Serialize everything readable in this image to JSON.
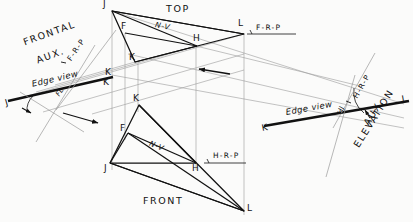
{
  "drawing": {
    "title": "Descriptive geometry — edge views of plane JKL",
    "ink_color": "#111111",
    "light_ink_color": "#8a8a8a",
    "paper_color": "#fbfbfa"
  },
  "views": {
    "top": {
      "label": "TOP"
    },
    "front": {
      "label": "FRONT"
    },
    "frontal_aux": {
      "line1": "FRONTAL",
      "line2": "AUX."
    },
    "aux_elevation": {
      "line1": "AUX.",
      "line2": "ELEVATION"
    }
  },
  "reference_planes": {
    "frp_top": "F-R-P",
    "frp_left": "F-R-P",
    "hrp_front": "H-R-P",
    "hrp_right": "H-R-P"
  },
  "edge_views": {
    "left": "Edge view",
    "right": "Edge view"
  },
  "fold_lines": {
    "fl": "FL",
    "hj": "HJ"
  },
  "normal_views": {
    "top_nv": "N-V",
    "front_nv": "N-V"
  },
  "points": {
    "top": [
      {
        "id": "J",
        "label": "J",
        "x": 112,
        "y": 11,
        "lx": 104,
        "ly": 1
      },
      {
        "id": "F",
        "label": "F",
        "x": 125,
        "y": 33,
        "lx": 123,
        "ly": 24
      },
      {
        "id": "H",
        "label": "H",
        "x": 197,
        "y": 46,
        "lx": 195,
        "ly": 36
      },
      {
        "id": "K",
        "label": "K",
        "x": 135,
        "y": 62,
        "lx": 131,
        "ly": 55
      },
      {
        "id": "L",
        "label": "L",
        "x": 244,
        "y": 34,
        "lx": 239,
        "ly": 20
      }
    ],
    "front": [
      {
        "id": "K",
        "label": "K",
        "x": 139,
        "y": 105,
        "lx": 134,
        "ly": 96
      },
      {
        "id": "F",
        "label": "F",
        "x": 128,
        "y": 133,
        "lx": 122,
        "ly": 126
      },
      {
        "id": "J",
        "label": "J",
        "x": 110,
        "y": 163,
        "lx": 105,
        "ly": 166
      },
      {
        "id": "H",
        "label": "H",
        "x": 196,
        "y": 163,
        "lx": 193,
        "ly": 166
      },
      {
        "id": "L",
        "label": "L",
        "x": 244,
        "y": 211,
        "lx": 248,
        "ly": 206
      }
    ],
    "frontal_aux": [
      {
        "id": "J",
        "label": "J",
        "x": 10,
        "y": 101,
        "lx": 4,
        "ly": 101
      },
      {
        "id": "K",
        "label": "K",
        "x": 110,
        "y": 78,
        "lx": 107,
        "ly": 74
      },
      {
        "id": "K2",
        "label": "K",
        "x": 109,
        "y": 79,
        "lx": 104,
        "ly": 82
      }
    ],
    "aux_elevation": [
      {
        "id": "K",
        "label": "K",
        "x": 266,
        "y": 127,
        "lx": 262,
        "ly": 126
      },
      {
        "id": "L",
        "label": "L",
        "x": 404,
        "y": 104,
        "lx": 403,
        "ly": 98
      }
    ]
  },
  "arrows": [
    {
      "name": "sight-arrow-top",
      "x1": 228,
      "y1": 73,
      "x2": 198,
      "y2": 69
    },
    {
      "name": "sight-arrow-front",
      "x1": 65,
      "y1": 114,
      "x2": 97,
      "y2": 122
    }
  ],
  "angle_marks": [
    {
      "name": "left-angle-arc",
      "cx": 28,
      "cy": 99
    },
    {
      "name": "right-angle-arc",
      "cx": 372,
      "cy": 113
    }
  ]
}
